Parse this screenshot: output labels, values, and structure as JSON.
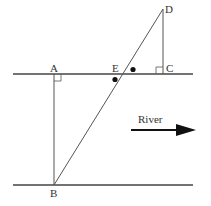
{
  "labels": {
    "A": "A",
    "B": "B",
    "C": "C",
    "D": "D",
    "E": "E",
    "river": "River"
  },
  "colors": {
    "line": "#444444",
    "text": "#333333",
    "arrow": "#111111"
  }
}
